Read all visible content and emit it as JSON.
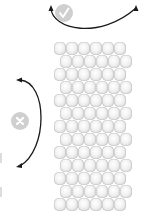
{
  "diagram": {
    "grid": {
      "rows": 13,
      "columns": 6,
      "offset_pattern": "alternating",
      "bead_color": "#e8e8e8"
    },
    "top_indicator": {
      "icon": "check-icon",
      "arrow": "double-headed-curved-arrow",
      "meaning": "correct"
    },
    "left_indicator": {
      "icon": "cross-icon",
      "arrow": "double-headed-curved-arrow",
      "meaning": "incorrect"
    },
    "colors": {
      "arrow": "#1a1a1a",
      "badge": "#cfcfcf",
      "badge_glyph": "#ffffff"
    }
  }
}
